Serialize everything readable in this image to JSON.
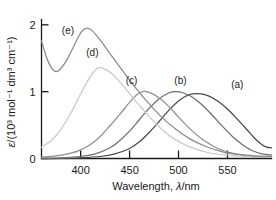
{
  "chart_data": {
    "type": "line",
    "title": "",
    "xlabel": "Wavelength, λ/nm",
    "ylabel": "ε/(10³ mol⁻¹ dm³ cm⁻¹)",
    "xlim": [
      360,
      595
    ],
    "ylim": [
      0,
      2.08
    ],
    "xticks": [
      400,
      450,
      500,
      550
    ],
    "xtick_labels": [
      "400",
      "450",
      "500",
      "550"
    ],
    "yticks": [
      0,
      1,
      2
    ],
    "ytick_labels": [
      "0",
      "1",
      "2"
    ],
    "grid": false,
    "legend_position": "inline-annotations",
    "series": [
      {
        "name": "(a)",
        "label": "(a)",
        "color": "#4a4a4a",
        "peak_x": 520,
        "peak_y": 0.97,
        "label_x": 560,
        "label_y": 1.06,
        "points": [
          [
            360,
            0.0
          ],
          [
            380,
            0.0
          ],
          [
            400,
            0.01
          ],
          [
            420,
            0.03
          ],
          [
            435,
            0.07
          ],
          [
            450,
            0.15
          ],
          [
            460,
            0.25
          ],
          [
            470,
            0.39
          ],
          [
            480,
            0.55
          ],
          [
            490,
            0.72
          ],
          [
            500,
            0.86
          ],
          [
            510,
            0.95
          ],
          [
            520,
            0.97
          ],
          [
            530,
            0.94
          ],
          [
            540,
            0.86
          ],
          [
            550,
            0.74
          ],
          [
            560,
            0.59
          ],
          [
            570,
            0.43
          ],
          [
            578,
            0.3
          ],
          [
            585,
            0.21
          ],
          [
            590,
            0.17
          ],
          [
            595,
            0.16
          ]
        ]
      },
      {
        "name": "(b)",
        "label": "(b)",
        "color": "#6e6e6e",
        "peak_x": 497,
        "peak_y": 1.0,
        "label_x": 502,
        "label_y": 1.12,
        "points": [
          [
            360,
            0.0
          ],
          [
            380,
            0.01
          ],
          [
            400,
            0.03
          ],
          [
            415,
            0.07
          ],
          [
            430,
            0.16
          ],
          [
            440,
            0.27
          ],
          [
            450,
            0.41
          ],
          [
            460,
            0.58
          ],
          [
            470,
            0.75
          ],
          [
            480,
            0.89
          ],
          [
            490,
            0.98
          ],
          [
            497,
            1.0
          ],
          [
            505,
            0.98
          ],
          [
            515,
            0.91
          ],
          [
            525,
            0.79
          ],
          [
            535,
            0.64
          ],
          [
            545,
            0.48
          ],
          [
            555,
            0.33
          ],
          [
            565,
            0.21
          ],
          [
            575,
            0.12
          ],
          [
            585,
            0.07
          ],
          [
            595,
            0.05
          ]
        ]
      },
      {
        "name": "(c)",
        "label": "(c)",
        "color": "#8f8f8f",
        "peak_x": 463,
        "peak_y": 1.0,
        "label_x": 452,
        "label_y": 1.12,
        "points": [
          [
            360,
            0.02
          ],
          [
            375,
            0.04
          ],
          [
            390,
            0.08
          ],
          [
            400,
            0.13
          ],
          [
            410,
            0.21
          ],
          [
            420,
            0.33
          ],
          [
            430,
            0.49
          ],
          [
            440,
            0.66
          ],
          [
            450,
            0.84
          ],
          [
            458,
            0.96
          ],
          [
            463,
            1.0
          ],
          [
            470,
            0.99
          ],
          [
            480,
            0.91
          ],
          [
            490,
            0.78
          ],
          [
            500,
            0.62
          ],
          [
            512,
            0.44
          ],
          [
            525,
            0.28
          ],
          [
            540,
            0.15
          ],
          [
            555,
            0.08
          ],
          [
            570,
            0.04
          ],
          [
            585,
            0.02
          ],
          [
            595,
            0.02
          ]
        ]
      },
      {
        "name": "(d)",
        "label": "(d)",
        "color": "#c9c9c9",
        "peak_x": 419,
        "peak_y": 1.36,
        "label_x": 412,
        "label_y": 1.53,
        "points": [
          [
            360,
            0.17
          ],
          [
            370,
            0.27
          ],
          [
            380,
            0.44
          ],
          [
            390,
            0.68
          ],
          [
            400,
            0.97
          ],
          [
            408,
            1.18
          ],
          [
            414,
            1.31
          ],
          [
            419,
            1.36
          ],
          [
            426,
            1.33
          ],
          [
            434,
            1.24
          ],
          [
            444,
            1.08
          ],
          [
            455,
            0.88
          ],
          [
            468,
            0.66
          ],
          [
            482,
            0.45
          ],
          [
            496,
            0.29
          ],
          [
            512,
            0.17
          ],
          [
            530,
            0.09
          ],
          [
            550,
            0.05
          ],
          [
            570,
            0.03
          ],
          [
            595,
            0.02
          ]
        ]
      },
      {
        "name": "(e)",
        "label": "(e)",
        "color": "#8a8a8a",
        "peak_x": 405,
        "peak_y": 1.95,
        "label_x": 387,
        "label_y": 1.86,
        "points": [
          [
            360,
            1.76
          ],
          [
            365,
            1.52
          ],
          [
            370,
            1.36
          ],
          [
            375,
            1.3
          ],
          [
            380,
            1.35
          ],
          [
            386,
            1.48
          ],
          [
            392,
            1.65
          ],
          [
            398,
            1.83
          ],
          [
            403,
            1.93
          ],
          [
            407,
            1.95
          ],
          [
            412,
            1.91
          ],
          [
            420,
            1.77
          ],
          [
            430,
            1.57
          ],
          [
            442,
            1.33
          ],
          [
            455,
            1.08
          ],
          [
            468,
            0.85
          ],
          [
            482,
            0.63
          ],
          [
            497,
            0.44
          ],
          [
            512,
            0.29
          ],
          [
            528,
            0.18
          ],
          [
            545,
            0.1
          ],
          [
            562,
            0.06
          ],
          [
            578,
            0.04
          ],
          [
            595,
            0.03
          ]
        ]
      }
    ]
  },
  "axes": {
    "y_label_parts": {
      "epsilon": "ε",
      "rest": "/(10³ mol⁻¹ dm³ cm⁻¹)"
    },
    "x_label_parts": {
      "word": "Wavelength,",
      "lambda": "λ",
      "unit": "/nm"
    }
  },
  "colors": {
    "axis": "#1a1a1a",
    "background": "#ffffff",
    "text": "#1a1a1a"
  }
}
